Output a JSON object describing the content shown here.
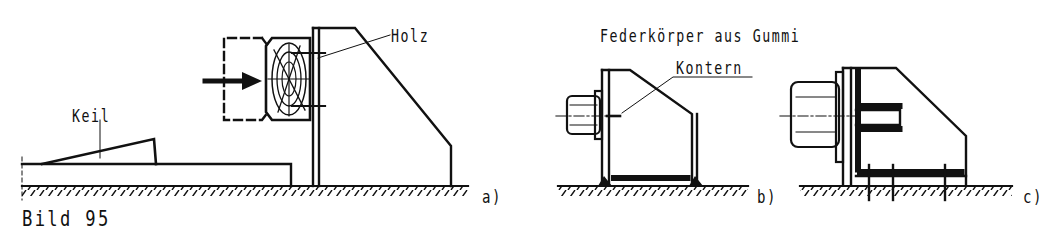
{
  "figure": {
    "title": "Bild 95",
    "colors": {
      "ink": "#111111",
      "background": "#ffffff"
    }
  },
  "panels": [
    {
      "id": "a",
      "sublabel": "a)",
      "labels": {
        "wedge": "Keil",
        "wood": "Holz"
      },
      "elements": [
        "wedge",
        "base-plate",
        "wooden-block",
        "dashed-machine-outline",
        "push-arrow",
        "bracket"
      ]
    },
    {
      "id": "b",
      "sublabel": "b)",
      "labels": {
        "heading": "Federkörper aus Gummi",
        "counter": "Kontern"
      },
      "elements": [
        "motor",
        "bracket",
        "weld-seam"
      ]
    },
    {
      "id": "c",
      "sublabel": "c)",
      "labels": {},
      "elements": [
        "motor",
        "bracket-with-rib",
        "anchor-bolts",
        "weld-seams"
      ]
    }
  ]
}
